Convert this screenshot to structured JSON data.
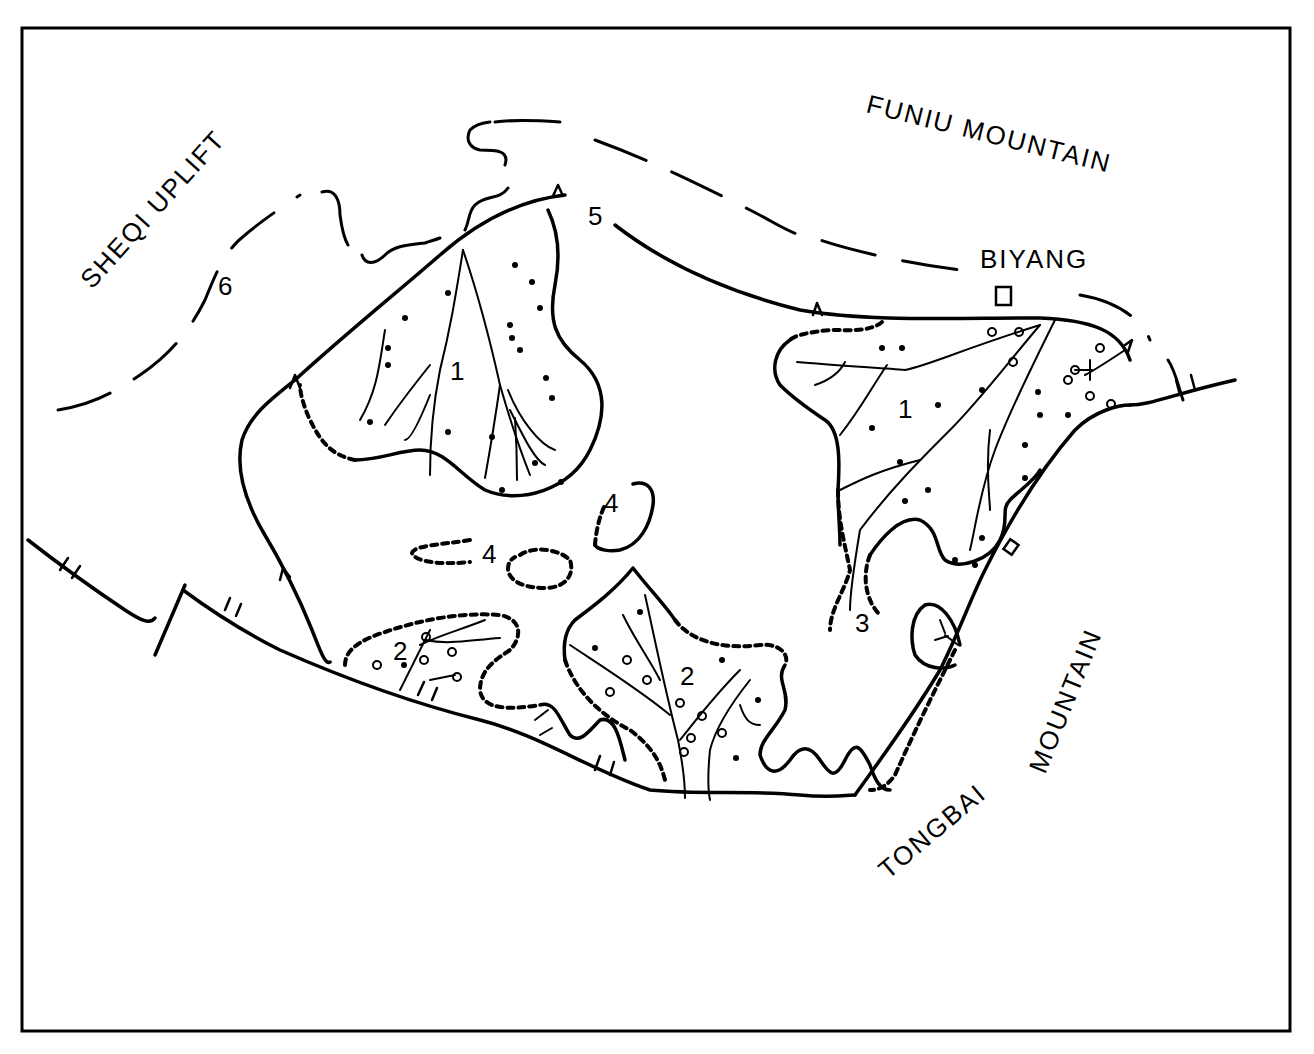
{
  "map": {
    "regions": {
      "sheqi_uplift": "SHEQI UPLIFT",
      "funiu_mountain": "FUNIU MOUNTAIN",
      "tongbai": "TONGBAI",
      "mountain": "MOUNTAIN"
    },
    "towns": {
      "biyang": "BIYANG"
    },
    "numbered_labels": {
      "fan_1_west": "1",
      "fan_1_east": "1",
      "fan_2_west": "2",
      "fan_2_center": "2",
      "lobe_3": "3",
      "lobe_4_a": "4",
      "lobe_4_b": "4",
      "boundary_5": "5",
      "boundary_6": "6"
    },
    "colors": {
      "ink": "#000000",
      "paper": "#ffffff"
    }
  }
}
